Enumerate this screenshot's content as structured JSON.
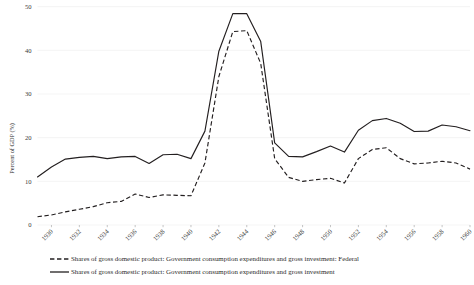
{
  "chart_data": {
    "type": "line",
    "title": "",
    "subtitle": "",
    "xlabel": "",
    "ylabel": "Percent of GDP (%)",
    "xlim": [
      1929,
      1960
    ],
    "ylim": [
      0,
      60
    ],
    "grid": true,
    "grid_axis": "y",
    "legend_position": "bottom",
    "ytick_labels": [
      "0",
      "10",
      "20",
      "30",
      "40",
      "50",
      "60"
    ],
    "ytick_values": [
      0,
      10,
      20,
      30,
      40,
      50,
      60
    ],
    "xtick_labels": [
      "1930",
      "1932",
      "1934",
      "1936",
      "1938",
      "1940",
      "1942",
      "1944",
      "1946",
      "1948",
      "1950",
      "1952",
      "1954",
      "1956",
      "1958",
      "1960"
    ],
    "xtick_values": [
      1930,
      1932,
      1934,
      1936,
      1938,
      1940,
      1942,
      1944,
      1946,
      1948,
      1950,
      1952,
      1954,
      1956,
      1958,
      1960
    ],
    "x": [
      1929,
      1930,
      1931,
      1932,
      1933,
      1934,
      1935,
      1936,
      1937,
      1938,
      1939,
      1940,
      1941,
      1942,
      1943,
      1944,
      1945,
      1946,
      1947,
      1948,
      1949,
      1950,
      1951,
      1952,
      1953,
      1954,
      1955,
      1956,
      1957,
      1958,
      1959,
      1960
    ],
    "series": [
      {
        "name": "Shares of gross domestic product: Government consumption expenditures and gross investment: Federal",
        "style": "dashed",
        "color": "#231f20",
        "values": [
          1.9,
          2.3,
          3.0,
          3.6,
          4.2,
          5.1,
          5.4,
          7.1,
          6.3,
          6.9,
          6.8,
          6.7,
          14.2,
          34.0,
          44.3,
          44.5,
          37.0,
          15.2,
          10.9,
          10.0,
          10.4,
          10.7,
          9.6,
          15.2,
          17.3,
          17.7,
          15.2,
          14.0,
          14.2,
          14.6,
          14.2,
          12.8
        ]
      },
      {
        "name": "Shares of gross domestic product: Government consumption expenditures and gross investment",
        "style": "solid",
        "color": "#231f20",
        "values": [
          11.0,
          13.3,
          15.1,
          15.5,
          15.7,
          15.2,
          15.6,
          15.7,
          14.1,
          16.1,
          16.2,
          15.2,
          21.5,
          39.8,
          48.4,
          48.4,
          42.0,
          18.8,
          15.7,
          15.6,
          16.8,
          18.1,
          16.7,
          21.7,
          23.9,
          24.4,
          23.3,
          21.4,
          21.5,
          22.9,
          22.5,
          21.6
        ]
      }
    ]
  },
  "legend": {
    "items": [
      {
        "label": "Shares of gross domestic product: Government consumption expenditures and gross investment: Federal",
        "style": "dashed"
      },
      {
        "label": "Shares of gross domestic product: Government consumption expenditures and gross investment",
        "style": "solid"
      }
    ]
  }
}
